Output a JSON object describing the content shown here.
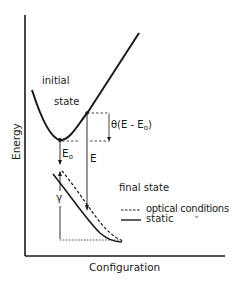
{
  "diagram": {
    "axes": {
      "ylabel": "Energy",
      "xlabel": "Configuration"
    },
    "curves": {
      "initial_state_line1": "initial",
      "initial_state_line2": "state",
      "final_state": "final state"
    },
    "annotations": {
      "E0": "E",
      "E0_sub": "o",
      "E": "E",
      "theta_prefix": "θ(E - E",
      "theta_sub": "o",
      "theta_suffix": ")",
      "gamma": "γ"
    },
    "legend": {
      "items": [
        {
          "style": "dashed",
          "label": "optical conditions"
        },
        {
          "style": "solid",
          "label": "static"
        }
      ],
      "ditto": "\""
    },
    "colors": {
      "ink": "#1a1a1a",
      "background": "#ffffff"
    }
  }
}
